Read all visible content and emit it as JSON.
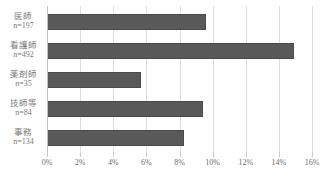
{
  "chart_data": {
    "type": "bar",
    "orientation": "horizontal",
    "title": "",
    "subtitle": "",
    "xlabel": "",
    "ylabel": "",
    "categories": [
      "医師",
      "看護師",
      "薬剤師",
      "技師等",
      "事務"
    ],
    "category_counts": [
      "n=197",
      "n=492",
      "n=35",
      "n=84",
      "n=134"
    ],
    "values": [
      9.6,
      14.9,
      5.7,
      9.4,
      8.3
    ],
    "xlim": [
      0,
      16
    ],
    "xtick_values": [
      0,
      2,
      4,
      6,
      8,
      10,
      12,
      14,
      16
    ],
    "xtick_labels": [
      "0%",
      "2%",
      "4%",
      "6%",
      "8%",
      "10%",
      "12%",
      "14%",
      "16%"
    ],
    "grid": true,
    "grid_axis": "x",
    "legend": false,
    "legend_position": "none",
    "series": [
      {
        "name": "",
        "values": [
          9.6,
          14.9,
          5.7,
          9.4,
          8.3
        ]
      }
    ]
  },
  "colors": {
    "bar_fill": "#595959",
    "bar_stroke": "#4a4a4a",
    "gridline": "#dedede",
    "axis": "#bfbfbf",
    "tick": "#cccccc",
    "label_text": "#7a7a7a",
    "tick_text": "#6e6e6e",
    "background": "#ffffff"
  }
}
